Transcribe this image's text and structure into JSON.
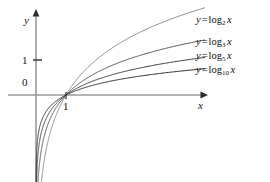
{
  "figure": {
    "axes": {
      "x_axis_label": "x",
      "y_axis_label": "y",
      "x_tick_label": "1",
      "y_tick_label": "1",
      "origin_label": "0"
    },
    "curves": [
      {
        "name": "log base 2",
        "base": "2",
        "lhs": "y",
        "equals": "=",
        "func": "log",
        "arg": "x",
        "color": "#8a8a8a"
      },
      {
        "name": "log base 3",
        "base": "3",
        "lhs": "y",
        "equals": "=",
        "func": "log",
        "arg": "x",
        "color": "#555555"
      },
      {
        "name": "log base 5",
        "base": "5",
        "lhs": "y",
        "equals": "=",
        "func": "log",
        "arg": "x",
        "color": "#3a3a3a"
      },
      {
        "name": "log base 10",
        "base": "10",
        "lhs": "y",
        "equals": "=",
        "func": "log",
        "arg": "x",
        "color": "#2b2b2b"
      }
    ]
  },
  "chart_data": {
    "type": "line",
    "title": "",
    "subtitle": "",
    "xlabel": "x",
    "ylabel": "y",
    "xlim": [
      0,
      9.4
    ],
    "ylim": [
      -2.8,
      3.3
    ],
    "xticks": [
      1
    ],
    "xtick_labels": [
      "1"
    ],
    "yticks": [
      1
    ],
    "ytick_labels": [
      "1"
    ],
    "grid": false,
    "legend": "inline-right-labels",
    "annotations": [
      {
        "text": "0",
        "x": -0.35,
        "y": -0.4,
        "note": "origin label"
      }
    ],
    "series": [
      {
        "name": "y = log_2 x",
        "base": 2,
        "label": "y = log₂ x",
        "color": "#8a8a8a",
        "x": [
          0.04,
          0.08,
          0.12,
          0.18,
          0.25,
          0.35,
          0.5,
          0.7,
          1.0,
          1.5,
          2.0,
          3.0,
          4.0,
          5.0,
          6.0,
          7.0,
          8.0,
          8.8
        ],
        "y": [
          -4.64,
          -3.64,
          -3.06,
          -2.47,
          -2.0,
          -1.51,
          -1.0,
          -0.51,
          0.0,
          0.58,
          1.0,
          1.58,
          2.0,
          2.32,
          2.58,
          2.81,
          3.0,
          3.14
        ]
      },
      {
        "name": "y = log_3 x",
        "base": 3,
        "label": "y = log₃ x",
        "color": "#555555",
        "x": [
          0.04,
          0.08,
          0.12,
          0.18,
          0.25,
          0.35,
          0.5,
          0.7,
          1.0,
          1.5,
          2.0,
          3.0,
          4.0,
          5.0,
          6.0,
          7.0,
          8.0,
          8.8
        ],
        "y": [
          -2.93,
          -2.3,
          -1.93,
          -1.56,
          -1.26,
          -0.96,
          -0.63,
          -0.32,
          0.0,
          0.37,
          0.63,
          1.0,
          1.26,
          1.46,
          1.63,
          1.77,
          1.89,
          1.98
        ]
      },
      {
        "name": "y = log_5 x",
        "base": 5,
        "label": "y = log₅ x",
        "color": "#3a3a3a",
        "x": [
          0.04,
          0.08,
          0.12,
          0.18,
          0.25,
          0.35,
          0.5,
          0.7,
          1.0,
          1.5,
          2.0,
          3.0,
          4.0,
          5.0,
          6.0,
          7.0,
          8.0,
          8.8
        ],
        "y": [
          -2.0,
          -1.57,
          -1.32,
          -1.07,
          -0.86,
          -0.65,
          -0.43,
          -0.22,
          0.0,
          0.25,
          0.43,
          0.68,
          0.86,
          1.0,
          1.11,
          1.21,
          1.29,
          1.35
        ]
      },
      {
        "name": "y = log_10 x",
        "base": 10,
        "label": "y = log₁₀ x",
        "color": "#2b2b2b",
        "x": [
          0.04,
          0.08,
          0.12,
          0.18,
          0.25,
          0.35,
          0.5,
          0.7,
          1.0,
          1.5,
          2.0,
          3.0,
          4.0,
          5.0,
          6.0,
          7.0,
          8.0,
          8.8
        ],
        "y": [
          -1.4,
          -1.1,
          -0.92,
          -0.74,
          -0.6,
          -0.46,
          -0.3,
          -0.15,
          0.0,
          0.18,
          0.3,
          0.48,
          0.6,
          0.7,
          0.78,
          0.85,
          0.9,
          0.94
        ]
      }
    ]
  }
}
